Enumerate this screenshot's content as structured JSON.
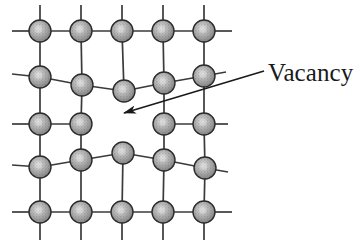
{
  "figure": {
    "background_color": "#ffffff",
    "width": 354,
    "height": 249
  },
  "annotation": {
    "label": "Vacancy",
    "label_x": 268,
    "label_y": 58,
    "font_size": 25,
    "text_color": "#1a1a1a"
  },
  "arrow": {
    "name": "vacancy-pointer-arrow",
    "start_x": 264,
    "start_y": 71,
    "end_x": 124,
    "end_y": 113,
    "color": "#1a1a1a",
    "stroke_width": 1.6,
    "head_length": 15,
    "head_width": 7
  },
  "lattice": {
    "bond_color": "#3a3a3a",
    "bond_width": 1.7,
    "atom_radius": 11,
    "atom_fill": "#9a9a9a",
    "atom_edge": "#2b2b2b",
    "atom_highlight": "#d9d9d9",
    "rows": 5,
    "columns": 5,
    "vacancy_row": 2,
    "vacancy_column": 2,
    "vacancy_note": "missing atom at row 3, column 3 (0-indexed row 2, column 2)",
    "atoms": [
      {
        "id": "a-r0-c0",
        "row": 0,
        "col": 0,
        "x": 40,
        "y": 31
      },
      {
        "id": "a-r0-c1",
        "row": 0,
        "col": 1,
        "x": 81,
        "y": 31
      },
      {
        "id": "a-r0-c2",
        "row": 0,
        "col": 2,
        "x": 122,
        "y": 31
      },
      {
        "id": "a-r0-c3",
        "row": 0,
        "col": 3,
        "x": 163,
        "y": 31
      },
      {
        "id": "a-r0-c4",
        "row": 0,
        "col": 4,
        "x": 204,
        "y": 31
      },
      {
        "id": "a-r1-c0",
        "row": 1,
        "col": 0,
        "x": 40,
        "y": 77
      },
      {
        "id": "a-r1-c1",
        "row": 1,
        "col": 1,
        "x": 82,
        "y": 85
      },
      {
        "id": "a-r1-c2",
        "row": 1,
        "col": 2,
        "x": 124,
        "y": 91
      },
      {
        "id": "a-r1-c3",
        "row": 1,
        "col": 3,
        "x": 164,
        "y": 83
      },
      {
        "id": "a-r1-c4",
        "row": 1,
        "col": 4,
        "x": 204,
        "y": 76
      },
      {
        "id": "a-r2-c0",
        "row": 2,
        "col": 0,
        "x": 40,
        "y": 124
      },
      {
        "id": "a-r2-c1",
        "row": 2,
        "col": 1,
        "x": 81,
        "y": 124
      },
      {
        "id": "a-r2-c3",
        "row": 2,
        "col": 3,
        "x": 164,
        "y": 124
      },
      {
        "id": "a-r2-c4",
        "row": 2,
        "col": 4,
        "x": 204,
        "y": 124
      },
      {
        "id": "a-r3-c0",
        "row": 3,
        "col": 0,
        "x": 40,
        "y": 167
      },
      {
        "id": "a-r3-c1",
        "row": 3,
        "col": 1,
        "x": 81,
        "y": 160
      },
      {
        "id": "a-r3-c2",
        "row": 3,
        "col": 2,
        "x": 123,
        "y": 153
      },
      {
        "id": "a-r3-c3",
        "row": 3,
        "col": 3,
        "x": 164,
        "y": 160
      },
      {
        "id": "a-r3-c4",
        "row": 3,
        "col": 4,
        "x": 205,
        "y": 168
      },
      {
        "id": "a-r4-c0",
        "row": 4,
        "col": 0,
        "x": 40,
        "y": 212
      },
      {
        "id": "a-r4-c1",
        "row": 4,
        "col": 1,
        "x": 81,
        "y": 212
      },
      {
        "id": "a-r4-c2",
        "row": 4,
        "col": 2,
        "x": 122,
        "y": 212
      },
      {
        "id": "a-r4-c3",
        "row": 4,
        "col": 3,
        "x": 163,
        "y": 212
      },
      {
        "id": "a-r4-c4",
        "row": 4,
        "col": 4,
        "x": 204,
        "y": 212
      }
    ],
    "bonds": [
      {
        "from": "edge-left-r0",
        "x1": 12,
        "y1": 31,
        "x2": 40,
        "y2": 31
      },
      {
        "from": "a-r0-c0",
        "x1": 40,
        "y1": 31,
        "x2": 81,
        "y2": 31
      },
      {
        "from": "a-r0-c1",
        "x1": 81,
        "y1": 31,
        "x2": 122,
        "y2": 31
      },
      {
        "from": "a-r0-c2",
        "x1": 122,
        "y1": 31,
        "x2": 163,
        "y2": 31
      },
      {
        "from": "a-r0-c3",
        "x1": 163,
        "y1": 31,
        "x2": 204,
        "y2": 31
      },
      {
        "from": "a-r0-c4",
        "x1": 204,
        "y1": 31,
        "x2": 232,
        "y2": 31
      },
      {
        "from": "a-r1-c0",
        "x1": 12,
        "y1": 74,
        "x2": 40,
        "y2": 77
      },
      {
        "from": "a-r1-c0",
        "x1": 40,
        "y1": 77,
        "x2": 82,
        "y2": 85
      },
      {
        "from": "a-r1-c1",
        "x1": 82,
        "y1": 85,
        "x2": 124,
        "y2": 91
      },
      {
        "from": "a-r1-c2",
        "x1": 124,
        "y1": 91,
        "x2": 164,
        "y2": 83
      },
      {
        "from": "a-r1-c3",
        "x1": 164,
        "y1": 83,
        "x2": 204,
        "y2": 76
      },
      {
        "from": "a-r1-c4",
        "x1": 204,
        "y1": 76,
        "x2": 226,
        "y2": 72
      },
      {
        "from": "a-r2-c0",
        "x1": 12,
        "y1": 124,
        "x2": 40,
        "y2": 124
      },
      {
        "from": "a-r2-c0",
        "x1": 40,
        "y1": 124,
        "x2": 81,
        "y2": 124
      },
      {
        "from": "a-r2-c3",
        "x1": 164,
        "y1": 124,
        "x2": 204,
        "y2": 124
      },
      {
        "from": "a-r2-c4",
        "x1": 204,
        "y1": 124,
        "x2": 228,
        "y2": 124
      },
      {
        "from": "a-r3-c0",
        "x1": 12,
        "y1": 165,
        "x2": 40,
        "y2": 167
      },
      {
        "from": "a-r3-c0",
        "x1": 40,
        "y1": 167,
        "x2": 81,
        "y2": 160
      },
      {
        "from": "a-r3-c1",
        "x1": 81,
        "y1": 160,
        "x2": 123,
        "y2": 153
      },
      {
        "from": "a-r3-c2",
        "x1": 123,
        "y1": 153,
        "x2": 164,
        "y2": 160
      },
      {
        "from": "a-r3-c3",
        "x1": 164,
        "y1": 160,
        "x2": 205,
        "y2": 168
      },
      {
        "from": "a-r3-c4",
        "x1": 205,
        "y1": 168,
        "x2": 228,
        "y2": 172
      },
      {
        "from": "edge-left-r4",
        "x1": 12,
        "y1": 212,
        "x2": 40,
        "y2": 212
      },
      {
        "from": "a-r4-c0",
        "x1": 40,
        "y1": 212,
        "x2": 81,
        "y2": 212
      },
      {
        "from": "a-r4-c1",
        "x1": 81,
        "y1": 212,
        "x2": 122,
        "y2": 212
      },
      {
        "from": "a-r4-c2",
        "x1": 122,
        "y1": 212,
        "x2": 163,
        "y2": 212
      },
      {
        "from": "a-r4-c3",
        "x1": 163,
        "y1": 212,
        "x2": 204,
        "y2": 212
      },
      {
        "from": "a-r4-c4",
        "x1": 204,
        "y1": 212,
        "x2": 232,
        "y2": 212
      },
      {
        "from": "top-stub-c0",
        "x1": 40,
        "y1": 5,
        "x2": 40,
        "y2": 31
      },
      {
        "from": "top-stub-c1",
        "x1": 81,
        "y1": 5,
        "x2": 81,
        "y2": 31
      },
      {
        "from": "top-stub-c2",
        "x1": 122,
        "y1": 5,
        "x2": 122,
        "y2": 31
      },
      {
        "from": "top-stub-c3",
        "x1": 163,
        "y1": 5,
        "x2": 163,
        "y2": 31
      },
      {
        "from": "top-stub-c4",
        "x1": 204,
        "y1": 5,
        "x2": 204,
        "y2": 31
      },
      {
        "from": "col0-r0-r1",
        "x1": 40,
        "y1": 31,
        "x2": 40,
        "y2": 77
      },
      {
        "from": "col0-r1-r2",
        "x1": 40,
        "y1": 77,
        "x2": 40,
        "y2": 124
      },
      {
        "from": "col0-r2-r3",
        "x1": 40,
        "y1": 124,
        "x2": 40,
        "y2": 167
      },
      {
        "from": "col0-r3-r4",
        "x1": 40,
        "y1": 167,
        "x2": 40,
        "y2": 212
      },
      {
        "from": "col1-r0-r1",
        "x1": 81,
        "y1": 31,
        "x2": 82,
        "y2": 85
      },
      {
        "from": "col1-r1-r2",
        "x1": 82,
        "y1": 85,
        "x2": 81,
        "y2": 124
      },
      {
        "from": "col1-r2-r3",
        "x1": 81,
        "y1": 124,
        "x2": 81,
        "y2": 160
      },
      {
        "from": "col1-r3-r4",
        "x1": 81,
        "y1": 160,
        "x2": 81,
        "y2": 212
      },
      {
        "from": "col2-r0-r1",
        "x1": 122,
        "y1": 31,
        "x2": 124,
        "y2": 91
      },
      {
        "from": "col2-r3-r4",
        "x1": 123,
        "y1": 153,
        "x2": 122,
        "y2": 212
      },
      {
        "from": "col3-r0-r1",
        "x1": 163,
        "y1": 31,
        "x2": 164,
        "y2": 83
      },
      {
        "from": "col3-r1-r2",
        "x1": 164,
        "y1": 83,
        "x2": 164,
        "y2": 124
      },
      {
        "from": "col3-r2-r3",
        "x1": 164,
        "y1": 124,
        "x2": 164,
        "y2": 160
      },
      {
        "from": "col3-r3-r4",
        "x1": 164,
        "y1": 160,
        "x2": 163,
        "y2": 212
      },
      {
        "from": "col4-r0-r1",
        "x1": 204,
        "y1": 31,
        "x2": 204,
        "y2": 76
      },
      {
        "from": "col4-r1-r2",
        "x1": 204,
        "y1": 76,
        "x2": 204,
        "y2": 124
      },
      {
        "from": "col4-r2-r3",
        "x1": 204,
        "y1": 124,
        "x2": 205,
        "y2": 168
      },
      {
        "from": "col4-r3-r4",
        "x1": 205,
        "y1": 168,
        "x2": 204,
        "y2": 212
      },
      {
        "from": "bot-stub-c0",
        "x1": 40,
        "y1": 212,
        "x2": 40,
        "y2": 240
      },
      {
        "from": "bot-stub-c1",
        "x1": 81,
        "y1": 212,
        "x2": 81,
        "y2": 240
      },
      {
        "from": "bot-stub-c2",
        "x1": 122,
        "y1": 212,
        "x2": 122,
        "y2": 240
      },
      {
        "from": "bot-stub-c3",
        "x1": 163,
        "y1": 212,
        "x2": 163,
        "y2": 240
      },
      {
        "from": "bot-stub-c4",
        "x1": 204,
        "y1": 212,
        "x2": 204,
        "y2": 240
      }
    ]
  }
}
